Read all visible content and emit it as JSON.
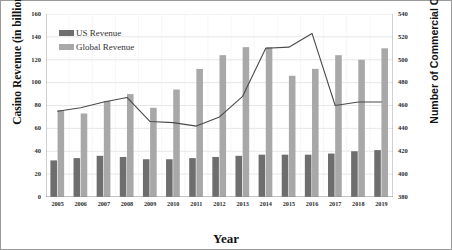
{
  "chart_data": {
    "type": "bar",
    "title": "",
    "xlabel": "Year",
    "ylabel": "Casino Revenue (in billions)",
    "y2label": "Number of Commercial Casinos",
    "grid": true,
    "legend_position": "top-left",
    "categories": [
      "2005",
      "2006",
      "2007",
      "2008",
      "2009",
      "2010",
      "2011",
      "2012",
      "2013",
      "2014",
      "2015",
      "2016",
      "2017",
      "2018",
      "2019"
    ],
    "ylim": [
      0,
      160
    ],
    "yticks": [
      0,
      20,
      40,
      60,
      80,
      100,
      120,
      140,
      160
    ],
    "y2lim": [
      380,
      540
    ],
    "y2ticks": [
      380,
      400,
      420,
      440,
      460,
      480,
      500,
      520,
      540
    ],
    "series": [
      {
        "name": "US Revenue",
        "type": "bar",
        "axis": "left",
        "color": "#6e6e6e",
        "values": [
          32,
          34,
          36,
          35,
          33,
          33,
          34,
          35,
          36,
          37,
          37,
          37,
          38,
          40,
          41
        ]
      },
      {
        "name": "Global Revenue",
        "type": "bar",
        "axis": "left",
        "color": "#a8a8a8",
        "values": [
          76,
          73,
          84,
          90,
          78,
          94,
          112,
          124,
          131,
          131,
          106,
          112,
          124,
          120,
          130
        ]
      },
      {
        "name": "Number of Commercial Casinos",
        "type": "line",
        "axis": "right",
        "color": "#4a4a4a",
        "values": [
          455,
          458,
          463,
          467,
          446,
          445,
          442,
          450,
          468,
          510,
          511,
          523,
          460,
          463,
          463
        ]
      }
    ]
  },
  "legend": {
    "items": [
      {
        "label": "US Revenue",
        "color": "#6e6e6e"
      },
      {
        "label": "Global Revenue",
        "color": "#a8a8a8"
      }
    ]
  },
  "axes": {
    "y_left_title": "Casino Revenue (in billions)",
    "y_right_title": "Number of Commercial Casinos",
    "x_title": "Year",
    "y_left_ticks": [
      "0",
      "20",
      "40",
      "60",
      "80",
      "100",
      "120",
      "140",
      "160"
    ],
    "y_right_ticks": [
      "380",
      "400",
      "420",
      "440",
      "460",
      "480",
      "500",
      "520",
      "540"
    ],
    "x_ticks": [
      "2005",
      "2006",
      "2007",
      "2008",
      "2009",
      "2010",
      "2011",
      "2012",
      "2013",
      "2014",
      "2015",
      "2016",
      "2017",
      "2018",
      "2019"
    ]
  },
  "colors": {
    "us_bar": "#6e6e6e",
    "global_bar": "#a8a8a8",
    "line": "#4a4a4a",
    "grid": "#dcdcdc",
    "axis": "#8c8c8c",
    "frame": "#9a9a9a",
    "text": "#1a1a1a"
  }
}
